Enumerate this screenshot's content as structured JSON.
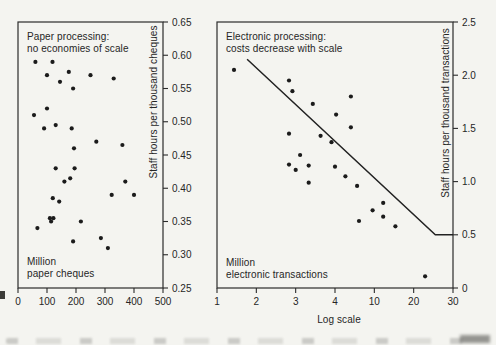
{
  "page": {
    "background": "#f4f4f0",
    "ink": "#2b2b2b",
    "dot_color": "#1b1b1b"
  },
  "chart_data": [
    {
      "id": "paper-processing",
      "type": "scatter",
      "title": "Paper processing:\nno economies of scale",
      "corner_label": "Million\npaper cheques",
      "ylabel": "Staff hours per thousand cheques",
      "x_scale": "linear",
      "xlim": [
        0,
        500
      ],
      "ylim": [
        0.25,
        0.65
      ],
      "x_ticks": [
        "0",
        "100",
        "200",
        "300",
        "400",
        "500"
      ],
      "y_ticks": [
        "0.65",
        "0.60",
        "0.55",
        "0.50",
        "0.45",
        "0.40",
        "0.35",
        "0.30",
        "0.25"
      ],
      "grid": false,
      "points": [
        [
          60,
          0.59
        ],
        [
          119,
          0.59
        ],
        [
          100,
          0.57
        ],
        [
          175,
          0.575
        ],
        [
          145,
          0.56
        ],
        [
          250,
          0.57
        ],
        [
          330,
          0.565
        ],
        [
          190,
          0.55
        ],
        [
          100,
          0.52
        ],
        [
          55,
          0.51
        ],
        [
          90,
          0.49
        ],
        [
          130,
          0.495
        ],
        [
          185,
          0.49
        ],
        [
          270,
          0.47
        ],
        [
          360,
          0.465
        ],
        [
          193,
          0.46
        ],
        [
          130,
          0.43
        ],
        [
          195,
          0.43
        ],
        [
          180,
          0.415
        ],
        [
          160,
          0.41
        ],
        [
          370,
          0.41
        ],
        [
          323,
          0.39
        ],
        [
          400,
          0.39
        ],
        [
          120,
          0.385
        ],
        [
          142,
          0.38
        ],
        [
          110,
          0.355
        ],
        [
          122,
          0.355
        ],
        [
          114,
          0.35
        ],
        [
          217,
          0.35
        ],
        [
          67,
          0.34
        ],
        [
          190,
          0.32
        ],
        [
          286,
          0.325
        ],
        [
          310,
          0.31
        ]
      ]
    },
    {
      "id": "electronic-processing",
      "type": "scatter",
      "title": "Electronic processing:\ncosts decrease with scale",
      "corner_label": "Million\nelectronic transactions",
      "ylabel": "Staff hours per thousand transactions",
      "x_axis_caption": "Log scale",
      "x_scale": "log-even-ticks",
      "xlim": [
        1,
        30
      ],
      "ylim": [
        0,
        2.5
      ],
      "x_ticks": [
        "1",
        "2",
        "3",
        "4",
        "10",
        "20",
        "30"
      ],
      "y_ticks": [
        "2.5",
        "2.0",
        "1.5",
        "1.0",
        "0.5",
        "0"
      ],
      "grid": false,
      "points": [
        [
          1.35,
          2.05
        ],
        [
          2.8,
          1.95
        ],
        [
          2.9,
          1.85
        ],
        [
          3.4,
          1.73
        ],
        [
          5.8,
          1.8
        ],
        [
          4.1,
          1.63
        ],
        [
          5.8,
          1.51
        ],
        [
          2.8,
          1.45
        ],
        [
          3.6,
          1.43
        ],
        [
          3.9,
          1.37
        ],
        [
          3.1,
          1.25
        ],
        [
          2.8,
          1.16
        ],
        [
          3.0,
          1.11
        ],
        [
          3.3,
          1.15
        ],
        [
          4.0,
          1.14
        ],
        [
          3.3,
          0.99
        ],
        [
          5.1,
          1.05
        ],
        [
          6.7,
          0.96
        ],
        [
          11.7,
          0.8
        ],
        [
          9.6,
          0.73
        ],
        [
          11.7,
          0.67
        ],
        [
          7.0,
          0.63
        ],
        [
          14.5,
          0.58
        ],
        [
          22.5,
          0.11
        ]
      ],
      "trend_line": [
        [
          1.7,
          2.15
        ],
        [
          25,
          0.5
        ],
        [
          30,
          0.5
        ]
      ]
    }
  ]
}
